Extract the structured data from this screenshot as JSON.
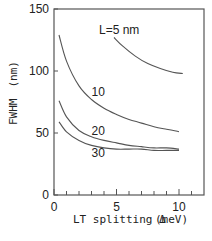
{
  "chart_data": {
    "type": "line",
    "title": "",
    "xlabel": "LT splitting Δ",
    "xunit": "(meV)",
    "ylabel": "FWHM",
    "yunit": "(nm)",
    "xlim": [
      0,
      12
    ],
    "ylim": [
      0,
      150
    ],
    "xticks": [
      0,
      5,
      10
    ],
    "yticks": [
      0,
      50,
      100,
      150
    ],
    "x_minor_ticks": [
      1,
      2,
      3,
      4,
      6,
      7,
      8,
      9,
      11
    ],
    "grid": false,
    "legend": "inline curve labels",
    "series": [
      {
        "name": "L=5 nm",
        "label": "L=5 nm",
        "x": [
          4.8,
          5.5,
          6.5,
          7.5,
          8.5,
          9.5,
          10.3
        ],
        "y": [
          127,
          120,
          112,
          106,
          102,
          99,
          98
        ]
      },
      {
        "name": "10",
        "label": "10",
        "x": [
          0.4,
          1,
          2,
          3,
          4,
          5,
          6,
          7,
          8,
          9,
          10
        ],
        "y": [
          129,
          108,
          88,
          77,
          70,
          65,
          61,
          58,
          55,
          53,
          51
        ]
      },
      {
        "name": "20",
        "label": "20",
        "x": [
          0.4,
          1,
          2,
          3,
          4,
          5,
          6,
          7,
          8,
          9,
          10
        ],
        "y": [
          76,
          63,
          52,
          47,
          44,
          42,
          40,
          39,
          38,
          38,
          37
        ]
      },
      {
        "name": "30",
        "label": "30",
        "x": [
          0.4,
          1,
          2,
          3,
          4,
          5,
          6,
          7,
          8,
          9,
          10
        ],
        "y": [
          59,
          51,
          44,
          40,
          38,
          37,
          37,
          37,
          36,
          36,
          36
        ]
      }
    ],
    "label_positions": [
      {
        "text": "L=5 nm",
        "x": 3.6,
        "y": 130
      },
      {
        "text": "10",
        "x": 3.0,
        "y": 80
      },
      {
        "text": "20",
        "x": 3.0,
        "y": 48
      },
      {
        "text": "30",
        "x": 3.0,
        "y": 31
      }
    ]
  },
  "axis_text": {
    "y_label": "FWHM　(nm)",
    "x_label": "LT splitting Δ",
    "x_unit": "(meV)",
    "y_ticks": [
      "150",
      "100",
      "50",
      "0"
    ],
    "x_ticks": [
      "0",
      "5",
      "10"
    ]
  }
}
